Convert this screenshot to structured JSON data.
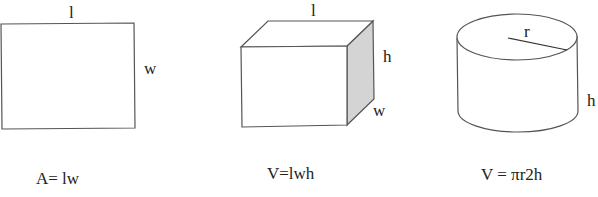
{
  "figures": [
    {
      "name": "rectangle",
      "labels": {
        "length": "l",
        "width": "w"
      },
      "formula": "A= lw"
    },
    {
      "name": "rectangular-prism",
      "labels": {
        "length": "l",
        "height": "h",
        "width": "w"
      },
      "formula": "V=lwh"
    },
    {
      "name": "cylinder",
      "labels": {
        "radius": "r",
        "height": "h"
      },
      "formula": "V = πr2h"
    }
  ],
  "colors": {
    "stroke": "#555555",
    "shaded_face": "#d4d4d4",
    "text": "#222222"
  }
}
